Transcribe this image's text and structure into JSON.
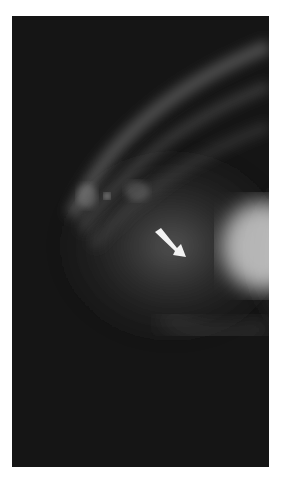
{
  "image": {
    "description": "Grayscale radiograph with soft-tissue density and a white annotation arrow pointing at a bright mass",
    "background_color": "#ffffff",
    "film_color": "#151515",
    "tissue_color": "#9a9a9a",
    "mass_color": "#e8e8e8"
  },
  "annotation": {
    "type": "arrow",
    "color": "#f2f2f2",
    "icon": "arrow-down-right-icon"
  }
}
